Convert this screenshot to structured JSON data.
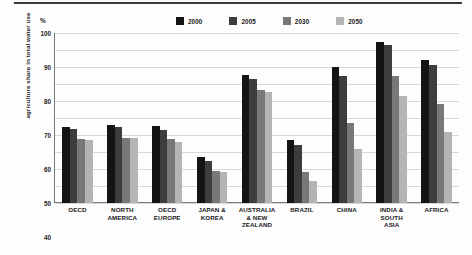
{
  "axis": {
    "y_title": "agriculture share in total water use",
    "unit_label": "%",
    "yticks": [
      100,
      90,
      80,
      70,
      60,
      50,
      40,
      30,
      20,
      10,
      0
    ]
  },
  "legend": {
    "items": [
      {
        "label": "2000",
        "color": "#141414"
      },
      {
        "label": "2005",
        "color": "#3d3d3d"
      },
      {
        "label": "2030",
        "color": "#787878"
      },
      {
        "label": "2050",
        "color": "#b4b4b4"
      }
    ]
  },
  "chart_data": {
    "type": "bar",
    "title": "",
    "xlabel": "",
    "ylabel": "agriculture share in total water use",
    "unit": "%",
    "ylim": [
      0,
      100
    ],
    "ytick_step": 10,
    "grid": true,
    "legend_position": "top",
    "categories": [
      "OECD",
      "NORTH AMERICA",
      "OECD EUROPE",
      "JAPAN & KOREA",
      "AUSTRALIA & NEW ZEALAND",
      "BRAZIL",
      "CHINA",
      "INDIA & SOUTH ASIA",
      "AFRICA"
    ],
    "series": [
      {
        "name": "2000",
        "color": "#141414",
        "values": [
          45,
          46,
          45.5,
          27,
          75.5,
          37,
          80,
          95,
          84
        ]
      },
      {
        "name": "2005",
        "color": "#3d3d3d",
        "values": [
          43.5,
          44.5,
          43,
          24.5,
          73,
          34,
          75,
          93,
          81
        ]
      },
      {
        "name": "2030",
        "color": "#787878",
        "values": [
          37.5,
          38.5,
          37.5,
          19,
          66.5,
          18.5,
          47,
          75,
          58
        ]
      },
      {
        "name": "2050",
        "color": "#b4b4b4",
        "values": [
          37,
          38.5,
          36,
          18.5,
          65.5,
          13,
          32,
          63,
          42
        ]
      }
    ]
  },
  "xaxis_display": [
    [
      "OECD"
    ],
    [
      "NORTH",
      "AMERICA"
    ],
    [
      "OECD",
      "EUROPE"
    ],
    [
      "JAPAN &",
      "KOREA"
    ],
    [
      "AUSTRALIA",
      "& NEW",
      "ZEALAND"
    ],
    [
      "BRAZIL"
    ],
    [
      "CHINA"
    ],
    [
      "INDIA &",
      "SOUTH",
      "ASIA"
    ],
    [
      "AFRICA"
    ]
  ]
}
